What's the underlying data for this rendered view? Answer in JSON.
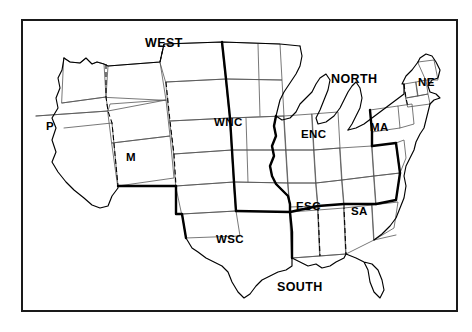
{
  "figure": {
    "background_color": "#ffffff",
    "frame_color": "#1a1a1a",
    "outline_color": "#000000",
    "state_border_color": "#555555",
    "width": 472,
    "height": 332
  },
  "regions": [
    {
      "id": "west",
      "label": "WEST",
      "x": 145,
      "y": 37
    },
    {
      "id": "north",
      "label": "NORTH",
      "x": 331,
      "y": 73
    },
    {
      "id": "south",
      "label": "SOUTH",
      "x": 277,
      "y": 281
    }
  ],
  "divisions": [
    {
      "id": "pacific",
      "label": "P",
      "x": 46,
      "y": 121
    },
    {
      "id": "mountain",
      "label": "M",
      "x": 126,
      "y": 152
    },
    {
      "id": "west-north-central",
      "label": "WNC",
      "x": 214,
      "y": 117
    },
    {
      "id": "east-north-central",
      "label": "ENC",
      "x": 301,
      "y": 129
    },
    {
      "id": "middle-atlantic",
      "label": "MA",
      "x": 370,
      "y": 122
    },
    {
      "id": "new-england",
      "label": "NE",
      "x": 418,
      "y": 77
    },
    {
      "id": "west-south-central",
      "label": "WSC",
      "x": 216,
      "y": 234
    },
    {
      "id": "east-south-central",
      "label": "ESC",
      "x": 296,
      "y": 201
    },
    {
      "id": "south-atlantic",
      "label": "SA",
      "x": 351,
      "y": 206
    }
  ]
}
